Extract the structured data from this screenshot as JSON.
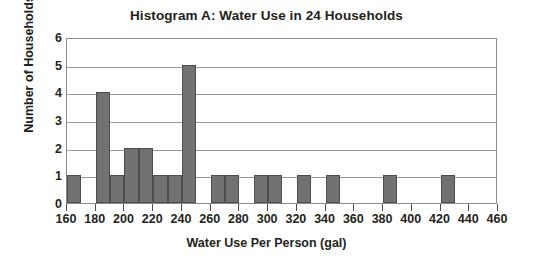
{
  "chart_data": {
    "type": "bar",
    "title": "Histogram A: Water Use in 24 Households",
    "xlabel": "Water Use Per Person (gal)",
    "ylabel": "Number of Households",
    "xlim": [
      160,
      460
    ],
    "ylim": [
      0,
      6
    ],
    "xtick_step": 20,
    "ytick_step": 1,
    "bin_width": 10,
    "grid": true,
    "legend": null,
    "bar_color": "#727272",
    "bar_edge_color": "#4d4d4d",
    "axis_color": "#8c8c8c",
    "text_color": "#231f20",
    "xticks": [
      160,
      180,
      200,
      220,
      240,
      260,
      280,
      300,
      320,
      340,
      360,
      380,
      400,
      420,
      440,
      460
    ],
    "yticks": [
      0,
      1,
      2,
      3,
      4,
      5,
      6
    ],
    "bin_starts": [
      160,
      170,
      180,
      190,
      200,
      210,
      220,
      230,
      240,
      250,
      260,
      270,
      280,
      290,
      300,
      310,
      320,
      330,
      340,
      350,
      360,
      370,
      380,
      390,
      400,
      410,
      420,
      430,
      440,
      450
    ],
    "values": [
      1,
      0,
      4,
      1,
      2,
      2,
      1,
      1,
      5,
      0,
      1,
      1,
      0,
      1,
      1,
      0,
      1,
      0,
      1,
      0,
      0,
      0,
      1,
      0,
      0,
      0,
      1,
      0,
      0,
      0
    ],
    "bars": [
      {
        "x0": 160,
        "x1": 170,
        "y": 1
      },
      {
        "x0": 180,
        "x1": 190,
        "y": 4
      },
      {
        "x0": 190,
        "x1": 200,
        "y": 1
      },
      {
        "x0": 200,
        "x1": 210,
        "y": 2
      },
      {
        "x0": 210,
        "x1": 220,
        "y": 2
      },
      {
        "x0": 220,
        "x1": 230,
        "y": 1
      },
      {
        "x0": 230,
        "x1": 240,
        "y": 1
      },
      {
        "x0": 240,
        "x1": 250,
        "y": 5
      },
      {
        "x0": 260,
        "x1": 270,
        "y": 1
      },
      {
        "x0": 270,
        "x1": 280,
        "y": 1
      },
      {
        "x0": 290,
        "x1": 300,
        "y": 1
      },
      {
        "x0": 300,
        "x1": 310,
        "y": 1
      },
      {
        "x0": 320,
        "x1": 330,
        "y": 1
      },
      {
        "x0": 340,
        "x1": 350,
        "y": 1
      },
      {
        "x0": 380,
        "x1": 390,
        "y": 1
      },
      {
        "x0": 420,
        "x1": 430,
        "y": 1
      }
    ],
    "total_count": 24
  }
}
